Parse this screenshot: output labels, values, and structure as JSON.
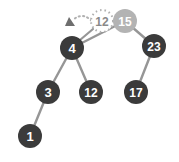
{
  "diagram": {
    "type": "binary-search-tree",
    "background_color": "#ffffff",
    "colors": {
      "node_fill": "#3b3b3b",
      "node_text": "#ffffff",
      "highlight_node_fill": "#b3b3b3",
      "highlight_node_text": "#ffffff",
      "edge": "#969696",
      "ghost_outline": "#b0b0b0",
      "ghost_text": "#8a8a8a",
      "pointer_arrow": "#6e6e6e"
    },
    "node_radius": 12,
    "ghost_radius": 11,
    "nodes": [
      {
        "id": "n4",
        "label": "4",
        "x": 72,
        "y": 48,
        "state": "normal",
        "font_size": 13
      },
      {
        "id": "n15",
        "label": "15",
        "x": 125,
        "y": 21,
        "state": "highlight",
        "font_size": 12
      },
      {
        "id": "n23",
        "label": "23",
        "x": 154,
        "y": 46,
        "state": "normal",
        "font_size": 12
      },
      {
        "id": "n3",
        "label": "3",
        "x": 48,
        "y": 92,
        "state": "normal",
        "font_size": 13
      },
      {
        "id": "n12",
        "label": "12",
        "x": 91,
        "y": 92,
        "state": "normal",
        "font_size": 12
      },
      {
        "id": "n17",
        "label": "17",
        "x": 136,
        "y": 92,
        "state": "normal",
        "font_size": 12
      },
      {
        "id": "n1",
        "label": "1",
        "x": 30,
        "y": 136,
        "state": "normal",
        "font_size": 13
      }
    ],
    "edges": [
      {
        "from": "n15",
        "to": "n4",
        "x1": 125,
        "y1": 21,
        "x2": 72,
        "y2": 48
      },
      {
        "from": "n15",
        "to": "n23",
        "x1": 125,
        "y1": 21,
        "x2": 154,
        "y2": 46
      },
      {
        "from": "n4",
        "to": "n3",
        "x1": 72,
        "y1": 48,
        "x2": 48,
        "y2": 92
      },
      {
        "from": "n4",
        "to": "n12",
        "x1": 72,
        "y1": 48,
        "x2": 91,
        "y2": 92
      },
      {
        "from": "n23",
        "to": "n17",
        "x1": 154,
        "y1": 46,
        "x2": 136,
        "y2": 92
      },
      {
        "from": "n3",
        "to": "n1",
        "x1": 48,
        "y1": 92,
        "x2": 30,
        "y2": 136
      }
    ],
    "ghost_node": {
      "id": "ghost12",
      "label": "12",
      "x": 102,
      "y": 21,
      "radius": 11,
      "font_size": 12,
      "style": "dashed-outline"
    },
    "pointer": {
      "name": "insert-pointer",
      "label": "",
      "arc_start_x": 97,
      "arc_start_y": 28,
      "arc_end_x": 73,
      "arc_end_y": 20,
      "arrow_tip_x": 68,
      "arrow_tip_y": 22,
      "style": "dotted-arc-with-triangle-arrowhead"
    },
    "stub_edge": {
      "name": "ghost-to-node-4-stub",
      "x1": 93,
      "y1": 29,
      "x2": 80,
      "y2": 40
    }
  }
}
